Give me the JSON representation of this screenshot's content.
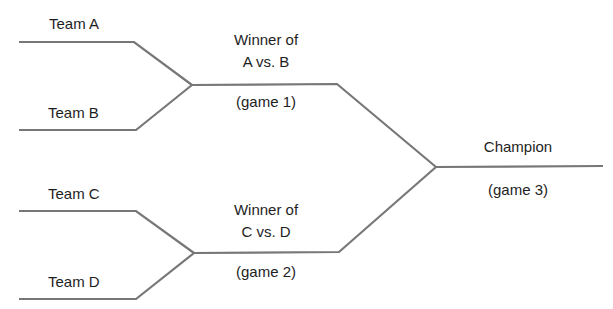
{
  "colors": {
    "line": "#777777",
    "text": "#1e1e1e",
    "background": "#ffffff"
  },
  "teams": [
    {
      "label": "Team A"
    },
    {
      "label": "Team B"
    },
    {
      "label": "Team C"
    },
    {
      "label": "Team D"
    }
  ],
  "games": [
    {
      "title_line1": "Winner of",
      "title_line2": "A vs. B",
      "game_label": "(game 1)"
    },
    {
      "title_line1": "Winner of",
      "title_line2": "C vs. D",
      "game_label": "(game 2)"
    },
    {
      "title": "Champion",
      "game_label": "(game 3)"
    }
  ],
  "bracket_geometry": {
    "team_a_line": {
      "y": 42,
      "x_start": 19,
      "x_corner": 134
    },
    "team_b_line": {
      "y": 130,
      "x_start": 19,
      "x_corner": 136
    },
    "game1_vertex": {
      "x": 192,
      "y": 85
    },
    "game1_line_end": {
      "x": 337,
      "y": 83
    },
    "team_c_line": {
      "y": 211,
      "x_start": 19,
      "x_corner": 136
    },
    "team_d_line": {
      "y": 299,
      "x_start": 19,
      "x_corner": 136
    },
    "game2_vertex": {
      "x": 194,
      "y": 253
    },
    "game2_line_end": {
      "x": 339,
      "y": 252
    },
    "game3_vertex": {
      "x": 436,
      "y": 167
    },
    "champion_line_end": {
      "x": 603,
      "y": 166
    }
  }
}
